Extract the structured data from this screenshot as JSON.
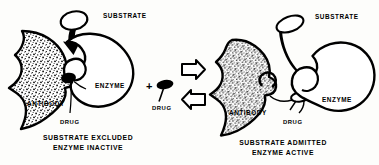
{
  "figure": {
    "background_color": "#fdfdfb",
    "ink_color": "#000000",
    "panel_count": 2
  },
  "panels": [
    {
      "id": "inactive",
      "position": "left",
      "caption_line1": "SUBSTRATE EXCLUDED",
      "caption_line2": "ENZYME INACTIVE",
      "labels": {
        "substrate": "SUBSTRATE",
        "enzyme": "ENZYME",
        "antibody": "ANTIBODY",
        "drug": "DRUG"
      },
      "state": {
        "substrate_binds": false,
        "enzyme_active": false,
        "drug_bound_to_antibody": true,
        "cleft": "closed"
      }
    },
    {
      "id": "active",
      "position": "right",
      "caption_line1": "SUBSTRATE ADMITTED",
      "caption_line2": "ENZYME ACTIVE",
      "labels": {
        "substrate": "SUBSTRATE",
        "enzyme": "ENZYME",
        "antibody": "ANTIBODY",
        "drug": "DRUG"
      },
      "state": {
        "substrate_binds": true,
        "enzyme_active": true,
        "drug_bound_to_antibody": true,
        "cleft": "open"
      }
    }
  ],
  "center": {
    "plus_sign": "+",
    "free_drug_label": "DRUG",
    "arrow_forward": "right-arrow",
    "arrow_reverse": "left-arrow",
    "reaction": "reversible"
  },
  "icons": {
    "substrate_oval": "substrate-oval-icon",
    "drug_pill": "drug-pill-icon",
    "block_arrow_right": "block-arrow-right-icon",
    "block_arrow_left": "block-arrow-left-icon",
    "thick_curved_arrow": "curved-arrow-icon",
    "antibody_blob": "antibody-blob-icon",
    "enzyme_blob": "enzyme-blob-icon"
  }
}
